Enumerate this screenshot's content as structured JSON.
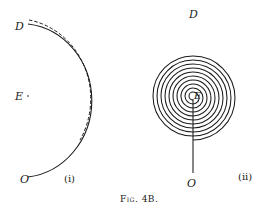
{
  "figure": {
    "caption": "Fig. 4B.",
    "panel_i": {
      "label": "(i)",
      "points": {
        "D": "D",
        "E": "E",
        "O": "O"
      },
      "description": "Semicircular arc from O to D around point E, with a dashed parallel arc outside"
    },
    "panel_ii": {
      "label": "(ii)",
      "points": {
        "D": "D",
        "E": "E",
        "O": "O"
      },
      "turns": 10,
      "description": "Spiral of concentric semicircle-built turns centered at E, with a straight radial line from E down to O"
    },
    "colors": {
      "ink": "#1a1a1a",
      "background": "#ffffff"
    }
  }
}
